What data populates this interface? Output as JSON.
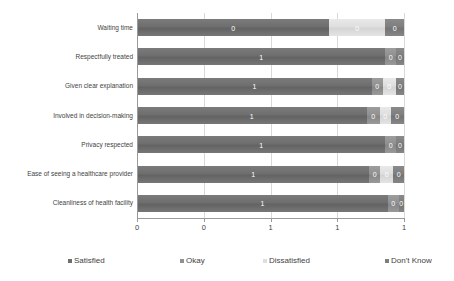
{
  "chart_data": {
    "type": "bar",
    "orientation": "horizontal",
    "stacked": "percent",
    "title": "",
    "subtitle": "",
    "xlabel": "",
    "ylabel": "",
    "xlim": [
      0,
      1
    ],
    "xticks": [
      0,
      0.25,
      0.5,
      0.75,
      1
    ],
    "xticklabels": [
      "0",
      "0",
      "1",
      "1",
      "1"
    ],
    "grid": "vertical",
    "legend_position": "bottom",
    "categories": [
      "Waiting time",
      "Respectfully treated",
      "Given clear explanation",
      "Involved in decision-making",
      "Privacy respected",
      "Ease of seeing a healthcare provider",
      "Cleanliness of health facility"
    ],
    "series": [
      {
        "name": "Satisfied",
        "color": "#6e6e6e",
        "values": [
          0.72,
          0.93,
          0.88,
          0.86,
          0.93,
          0.87,
          0.94
        ],
        "labels": [
          "0",
          "1",
          "1",
          "1",
          "1",
          "1",
          "1"
        ]
      },
      {
        "name": "Okay",
        "color": "#919191",
        "values": [
          0.0,
          0.04,
          0.04,
          0.05,
          0.04,
          0.04,
          0.04
        ],
        "labels": [
          "0",
          "0",
          "0",
          "0",
          "0",
          "0",
          "0"
        ]
      },
      {
        "name": "Dissatisfied",
        "color": "#dedede",
        "values": [
          0.21,
          0.0,
          0.05,
          0.04,
          0.0,
          0.05,
          0.0
        ],
        "labels": [
          "0",
          "0",
          "0",
          "0",
          "0",
          "0",
          "0"
        ]
      },
      {
        "name": "Don't Know",
        "color": "#7e7e7e",
        "values": [
          0.07,
          0.03,
          0.03,
          0.05,
          0.03,
          0.04,
          0.02
        ],
        "labels": [
          "0",
          "0",
          "0",
          "0",
          "0",
          "0",
          "0"
        ]
      }
    ]
  },
  "legend": {
    "items": [
      {
        "label": "Satisfied",
        "color": "#6e6e6e",
        "x": 68
      },
      {
        "label": "Okay",
        "color": "#919191",
        "x": 180
      },
      {
        "label": "Dissatisfied",
        "color": "#dedede",
        "x": 263
      },
      {
        "label": "Don't Know",
        "color": "#7e7e7e",
        "x": 385
      }
    ]
  }
}
